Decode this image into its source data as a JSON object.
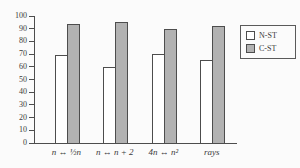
{
  "chart_data": {
    "type": "bar",
    "categories": [
      "n ↔ ½n",
      "n ↔ n + 2",
      "4n ↔ n²",
      "rays"
    ],
    "series": [
      {
        "name": "N-ST",
        "values": [
          69,
          60,
          70,
          65
        ],
        "fill": "#ffffff",
        "border": "#4d4d4d"
      },
      {
        "name": "C-ST",
        "values": [
          94,
          95,
          90,
          92
        ],
        "fill": "#b2b2b2",
        "border": "#4d4d4d"
      }
    ],
    "title": "",
    "xlabel": "",
    "ylabel": "",
    "ylim": [
      0,
      100
    ],
    "yticks": [
      0,
      10,
      20,
      30,
      40,
      50,
      60,
      70,
      80,
      90,
      100
    ],
    "grid": false,
    "legend_position": "top-right"
  },
  "colors": {
    "background": "#fbfbfb",
    "axis": "#4d4d4d",
    "text": "#3a3a3a"
  }
}
